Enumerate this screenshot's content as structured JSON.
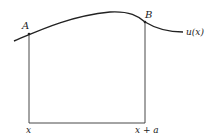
{
  "diagram": {
    "labels": {
      "point_a": "A",
      "point_b": "B",
      "curve": "u(x)",
      "x_left": "x",
      "x_right": "x + a"
    },
    "colors": {
      "stroke": "#222222",
      "background": "#ffffff"
    }
  }
}
